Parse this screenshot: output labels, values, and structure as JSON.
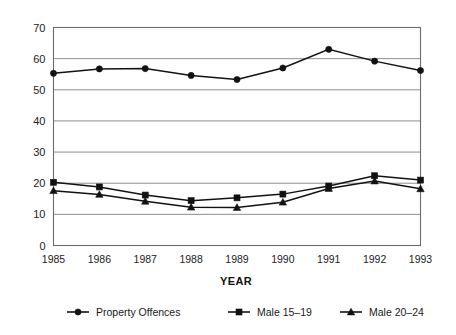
{
  "chart_data": {
    "type": "line",
    "title": "",
    "subtitle": "",
    "xlabel": "YEAR",
    "ylabel": "",
    "categories": [
      "1985",
      "1986",
      "1987",
      "1988",
      "1989",
      "1990",
      "1991",
      "1992",
      "1993"
    ],
    "x": [
      1985,
      1986,
      1987,
      1988,
      1989,
      1990,
      1991,
      1992,
      1993
    ],
    "ylim": [
      0,
      70
    ],
    "yticks": [
      0,
      10,
      20,
      30,
      40,
      50,
      60,
      70
    ],
    "ytick_labels": [
      "0",
      "10",
      "20",
      "30",
      "40",
      "50",
      "60",
      "70"
    ],
    "grid": "horizontal",
    "legend_position": "bottom",
    "series": [
      {
        "name": "Property Offences",
        "marker": "circle",
        "color": "#121212",
        "values": [
          55.3,
          56.7,
          56.8,
          54.6,
          53.3,
          57.0,
          63.0,
          59.2,
          56.2
        ]
      },
      {
        "name": "Male 15–19",
        "marker": "square",
        "color": "#121212",
        "values": [
          20.3,
          18.8,
          16.2,
          14.4,
          15.3,
          16.5,
          19.1,
          22.4,
          21.0
        ]
      },
      {
        "name": "Male 20–24",
        "marker": "triangle",
        "color": "#121212",
        "values": [
          17.6,
          16.4,
          14.2,
          12.3,
          12.2,
          13.9,
          18.3,
          20.7,
          18.2
        ]
      }
    ]
  },
  "axis": {
    "x_title": "YEAR"
  },
  "legend": {
    "items": [
      {
        "label": "Property Offences",
        "marker": "circle"
      },
      {
        "label": "Male 15–19",
        "marker": "square"
      },
      {
        "label": "Male 20–24",
        "marker": "triangle"
      }
    ]
  }
}
